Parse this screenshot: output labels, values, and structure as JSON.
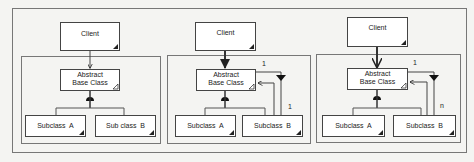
{
  "diagram": {
    "panels": [
      {
        "id": "panel-1",
        "client": "Client",
        "abstract_line1": "Abstract",
        "abstract_line2": "Base Class",
        "subclass_a": "Subclass  A",
        "subclass_b": "Sub class  B"
      },
      {
        "id": "panel-2",
        "client": "Client",
        "abstract_line1": "Abstract",
        "abstract_line2": "Base Class",
        "subclass_a": "Subclass  A",
        "subclass_b": "Subclass  B",
        "mult_top": "1",
        "mult_side": "1"
      },
      {
        "id": "panel-3",
        "client": "Client",
        "abstract_line1": "Abstract",
        "abstract_line2": "Base Class",
        "subclass_a": "Subclass  A",
        "subclass_b": "Subclass  B",
        "mult_top": "1",
        "mult_side": "n"
      }
    ],
    "colors": {
      "line": "#333333",
      "box_fill": "#ffffff",
      "frame": "#666666",
      "background": "#f4f4f2"
    }
  }
}
